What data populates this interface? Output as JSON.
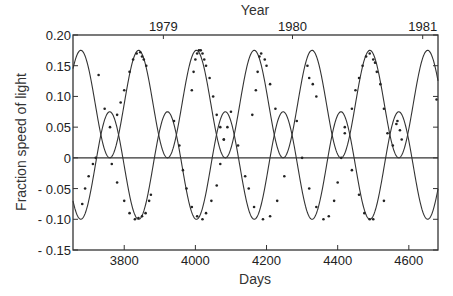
{
  "chart_data": {
    "type": "scatter",
    "title": "",
    "xlabel": "Days",
    "ylabel": "Fraction speed of light",
    "top_xlabel": "Year",
    "xlim": [
      3656,
      4682
    ],
    "ylim": [
      -0.15,
      0.2
    ],
    "xticks": [
      3800,
      4000,
      4200,
      4400,
      4600
    ],
    "xtick_labels": [
      "3800",
      "4000",
      "4200",
      "4400",
      "4600"
    ],
    "yticks": [
      0.2,
      0.15,
      0.1,
      0.05,
      0,
      -0.05,
      -0.1,
      -0.15
    ],
    "ytick_labels": [
      "0.20",
      "0.15",
      "0.10",
      "0.05",
      "0",
      "- 0.05",
      "- 0.10",
      "- 0.15"
    ],
    "top_ticks": [
      {
        "label": "1979",
        "day": 3910
      },
      {
        "label": "1980",
        "day": 4273
      },
      {
        "label": "1981",
        "day": 4639
      }
    ],
    "grid": false,
    "legend": null,
    "zero_line": true,
    "model_curves": [
      {
        "name": "redshifted jet",
        "center": 0.0875,
        "amplitude": 0.0875,
        "period_days": 162.5,
        "peak_day": 3678,
        "sign": 1
      },
      {
        "name": "blueshifted jet",
        "center": -0.0125,
        "amplitude": 0.0875,
        "period_days": 162.5,
        "peak_day": 3678,
        "sign": -1
      }
    ],
    "series": [
      {
        "name": "redshifted observations",
        "x": [
          3728,
          3745,
          3760,
          3780,
          3790,
          3800,
          3815,
          3825,
          3835,
          3845,
          3850,
          3855,
          3862,
          3990,
          3995,
          4000,
          4005,
          4010,
          4015,
          4020,
          4025,
          4030,
          4040,
          4050,
          4060,
          4070,
          4080,
          4160,
          4170,
          4175,
          4180,
          4185,
          4195,
          4200,
          4210,
          4225,
          4315,
          4320,
          4330,
          4340,
          4420,
          4440,
          4450,
          4460,
          4470,
          4480,
          4490,
          4500,
          4505,
          4510,
          4520,
          4530,
          4540,
          4568,
          4678
        ],
        "y": [
          0.135,
          0.08,
          0.05,
          0.07,
          0.09,
          0.11,
          0.14,
          0.16,
          0.17,
          0.172,
          0.165,
          0.16,
          0.15,
          0.11,
          0.14,
          0.16,
          0.17,
          0.175,
          0.175,
          0.17,
          0.16,
          0.15,
          0.13,
          0.1,
          0.07,
          0.05,
          0.03,
          0.07,
          0.11,
          0.14,
          0.165,
          0.17,
          0.16,
          0.15,
          0.12,
          0.08,
          0.15,
          0.13,
          0.12,
          0.1,
          0.05,
          0.08,
          0.11,
          0.13,
          0.15,
          0.165,
          0.17,
          0.16,
          0.155,
          0.14,
          0.12,
          0.08,
          0.04,
          0.06,
          0.095
        ]
      },
      {
        "name": "blueshifted observations",
        "x": [
          3682,
          3690,
          3700,
          3712,
          3720,
          3765,
          3780,
          3800,
          3815,
          3830,
          3840,
          3850,
          3860,
          3870,
          3875,
          3940,
          3955,
          3965,
          3975,
          3990,
          4005,
          4020,
          4030,
          4045,
          4060,
          4070,
          4080,
          4090,
          4100,
          4120,
          4140,
          4150,
          4165,
          4190,
          4210,
          4230,
          4250,
          4285,
          4300,
          4320,
          4340,
          4360,
          4375,
          4390,
          4400,
          4410,
          4420,
          4440,
          4460,
          4475,
          4490,
          4500,
          4530,
          4555,
          4565,
          4575,
          4580
        ],
        "y": [
          -0.075,
          -0.05,
          -0.03,
          -0.01,
          0.0,
          -0.01,
          -0.04,
          -0.07,
          -0.09,
          -0.1,
          -0.098,
          -0.095,
          -0.09,
          -0.07,
          -0.06,
          0.06,
          0.02,
          -0.02,
          -0.05,
          -0.08,
          -0.095,
          -0.1,
          -0.09,
          -0.07,
          -0.045,
          -0.01,
          0.03,
          0.05,
          0.075,
          0.02,
          -0.03,
          -0.05,
          -0.08,
          -0.1,
          -0.095,
          -0.07,
          -0.03,
          0.06,
          0.0,
          -0.05,
          -0.08,
          -0.1,
          -0.095,
          -0.07,
          -0.04,
          0.0,
          0.04,
          -0.02,
          -0.06,
          -0.09,
          -0.1,
          -0.1,
          -0.07,
          0.02,
          0.055,
          0.045,
          0.03
        ]
      }
    ]
  },
  "axes": {
    "x_title": "Days",
    "y_title": "Fraction speed of light",
    "top_title": "Year"
  }
}
